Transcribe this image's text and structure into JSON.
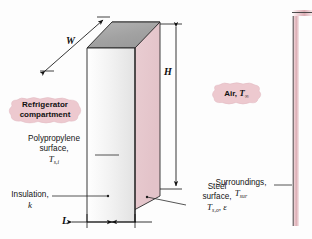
{
  "figure": {
    "callouts": {
      "refrigerator": {
        "line1": "Refrigerator",
        "line2": "compartment"
      },
      "air": {
        "text": "Air,",
        "symbol": "T",
        "subscript": "∞"
      }
    },
    "labels": {
      "polypropylene": {
        "line1": "Polypropylene",
        "line2": "surface,",
        "symbol": "T",
        "subscript": "s,i"
      },
      "insulation": {
        "line1": "Insulation,",
        "symbol": "k"
      },
      "steel": {
        "line1": "Steel",
        "line2": "surface,",
        "symbol": "T",
        "subscript": "s,o",
        "comma": ",",
        "emissivity": "ε"
      },
      "surroundings": {
        "line1": "Surroundings,",
        "symbol": "T",
        "subscript": "sur"
      }
    },
    "dimensions": {
      "width": "W",
      "height": "H",
      "thickness": "L"
    },
    "colors": {
      "front_face": "#f2f2f2",
      "top_face": "#a8a8a8",
      "right_face": "#e9ced2",
      "callout_fill": "#edc9cf",
      "wall_pink": "#e3b9bf",
      "outline": "#1b1b1b",
      "leader": "#2a2a2a"
    }
  }
}
